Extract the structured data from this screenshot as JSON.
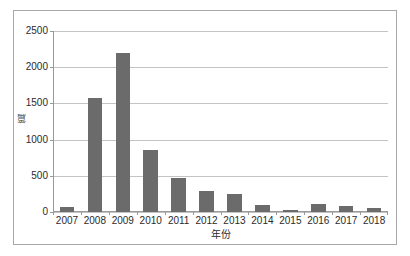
{
  "chart_data": {
    "type": "bar",
    "title": "",
    "subtitle": "",
    "xlabel": "年份",
    "ylabel": "篇",
    "categories": [
      "2007",
      "2008",
      "2009",
      "2010",
      "2011",
      "2012",
      "2013",
      "2014",
      "2015",
      "2016",
      "2017",
      "2018"
    ],
    "values": [
      75,
      1570,
      2200,
      850,
      475,
      285,
      250,
      95,
      25,
      115,
      85,
      55
    ],
    "series": [
      {
        "name": "",
        "values": [
          75,
          1570,
          2200,
          850,
          475,
          285,
          250,
          95,
          25,
          115,
          85,
          55
        ]
      }
    ],
    "ylim": [
      0,
      2500
    ],
    "yticks": [
      0,
      500,
      1000,
      1500,
      2000,
      2500
    ],
    "ytick_labels": [
      "0",
      "500",
      "1000",
      "1500",
      "2000",
      "2500"
    ],
    "grid": true,
    "grid_axis": "y",
    "legend": false,
    "legend_position": "none",
    "bar_color": "#6b6b6b",
    "grid_color": "#c4c4c4",
    "axis_color": "#9a9a9a",
    "plot_background": "#ffffff",
    "figure_border_color": "#a8a8a8"
  }
}
